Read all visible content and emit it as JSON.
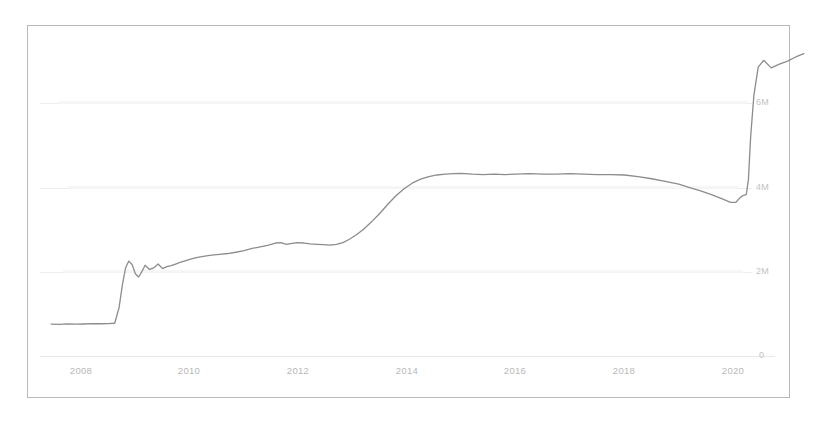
{
  "chart_data": {
    "type": "line",
    "title": "",
    "subtitle": "",
    "xlabel": "",
    "ylabel": "",
    "xtick_labels": [
      "2008",
      "2010",
      "2012",
      "2014",
      "2016",
      "2018",
      "2020"
    ],
    "ytick_labels": [
      "0",
      "2M",
      "4M",
      "6M"
    ],
    "ytick_values": [
      0,
      2000000,
      4000000,
      6000000
    ],
    "ylim": [
      0,
      7600000
    ],
    "xlim": [
      2007.4,
      2021.4
    ],
    "grid": true,
    "grid_axis": "y",
    "legend": null,
    "legend_position": "none",
    "yaxis_side": "right",
    "line_color": "#8c8c8c",
    "line_width": 1.3,
    "series": [
      {
        "name": "series-1",
        "x": [
          2007.45,
          2007.6,
          2007.75,
          2007.9,
          2008.05,
          2008.2,
          2008.35,
          2008.5,
          2008.62,
          2008.7,
          2008.76,
          2008.82,
          2008.88,
          2008.94,
          2009.0,
          2009.06,
          2009.12,
          2009.18,
          2009.26,
          2009.34,
          2009.42,
          2009.5,
          2009.58,
          2009.66,
          2009.74,
          2009.82,
          2009.9,
          2010.0,
          2010.12,
          2010.25,
          2010.4,
          2010.55,
          2010.7,
          2010.85,
          2011.0,
          2011.15,
          2011.3,
          2011.45,
          2011.58,
          2011.68,
          2011.78,
          2011.88,
          2011.98,
          2012.1,
          2012.22,
          2012.34,
          2012.46,
          2012.58,
          2012.7,
          2012.82,
          2012.94,
          2013.06,
          2013.2,
          2013.35,
          2013.5,
          2013.65,
          2013.8,
          2013.95,
          2014.1,
          2014.25,
          2014.4,
          2014.55,
          2014.7,
          2014.85,
          2015.0,
          2015.2,
          2015.4,
          2015.6,
          2015.8,
          2016.0,
          2016.25,
          2016.5,
          2016.75,
          2017.0,
          2017.25,
          2017.5,
          2017.75,
          2018.0,
          2018.25,
          2018.5,
          2018.75,
          2019.0,
          2019.2,
          2019.4,
          2019.6,
          2019.8,
          2019.95,
          2020.05,
          2020.12,
          2020.18,
          2020.24,
          2020.28,
          2020.32,
          2020.38,
          2020.46,
          2020.56,
          2020.7,
          2020.85,
          2021.0,
          2021.15,
          2021.3
        ],
        "values": [
          760000,
          755000,
          765000,
          758000,
          762000,
          770000,
          768000,
          772000,
          780000,
          1150000,
          1680000,
          2100000,
          2260000,
          2180000,
          1960000,
          1880000,
          2010000,
          2160000,
          2060000,
          2100000,
          2190000,
          2080000,
          2130000,
          2150000,
          2190000,
          2230000,
          2260000,
          2300000,
          2340000,
          2370000,
          2400000,
          2420000,
          2440000,
          2470000,
          2510000,
          2560000,
          2600000,
          2640000,
          2690000,
          2700000,
          2660000,
          2680000,
          2700000,
          2690000,
          2670000,
          2660000,
          2650000,
          2640000,
          2660000,
          2700000,
          2780000,
          2880000,
          3020000,
          3200000,
          3400000,
          3620000,
          3820000,
          3990000,
          4120000,
          4210000,
          4270000,
          4310000,
          4330000,
          4340000,
          4350000,
          4330000,
          4320000,
          4330000,
          4320000,
          4330000,
          4340000,
          4330000,
          4330000,
          4340000,
          4330000,
          4320000,
          4320000,
          4310000,
          4270000,
          4220000,
          4160000,
          4090000,
          4010000,
          3930000,
          3840000,
          3740000,
          3660000,
          3660000,
          3760000,
          3820000,
          3840000,
          4200000,
          5200000,
          6200000,
          6880000,
          7040000,
          6860000,
          6950000,
          7020000,
          7120000,
          7200000
        ]
      }
    ]
  }
}
